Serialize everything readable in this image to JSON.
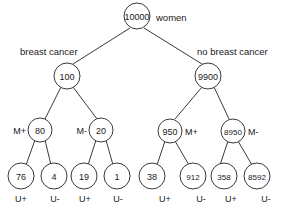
{
  "diagram": {
    "stroke_color": "#3a3a3a",
    "text_color": "#1a1a1a",
    "background_color": "#ffffff",
    "root": {
      "value": "10000",
      "annotation": "women"
    },
    "branch_labels": {
      "left": "breast cancer",
      "right": "no breast cancer"
    },
    "level2": [
      {
        "value": "100"
      },
      {
        "value": "9900"
      }
    ],
    "level3": [
      {
        "value": "80",
        "tag": "M+",
        "tag_side": "left"
      },
      {
        "value": "20",
        "tag": "M-",
        "tag_side": "left"
      },
      {
        "value": "950",
        "tag": "M+",
        "tag_side": "right"
      },
      {
        "value": "8950",
        "tag": "M-",
        "tag_side": "right"
      }
    ],
    "leaves": [
      {
        "value": "76",
        "tag": "U+"
      },
      {
        "value": "4",
        "tag": "U-"
      },
      {
        "value": "19",
        "tag": "U+"
      },
      {
        "value": "1",
        "tag": "U-"
      },
      {
        "value": "38",
        "tag": "U+"
      },
      {
        "value": "912",
        "tag": "U-"
      },
      {
        "value": "358",
        "tag": "U+"
      },
      {
        "value": "8592",
        "tag": "U-"
      }
    ]
  }
}
